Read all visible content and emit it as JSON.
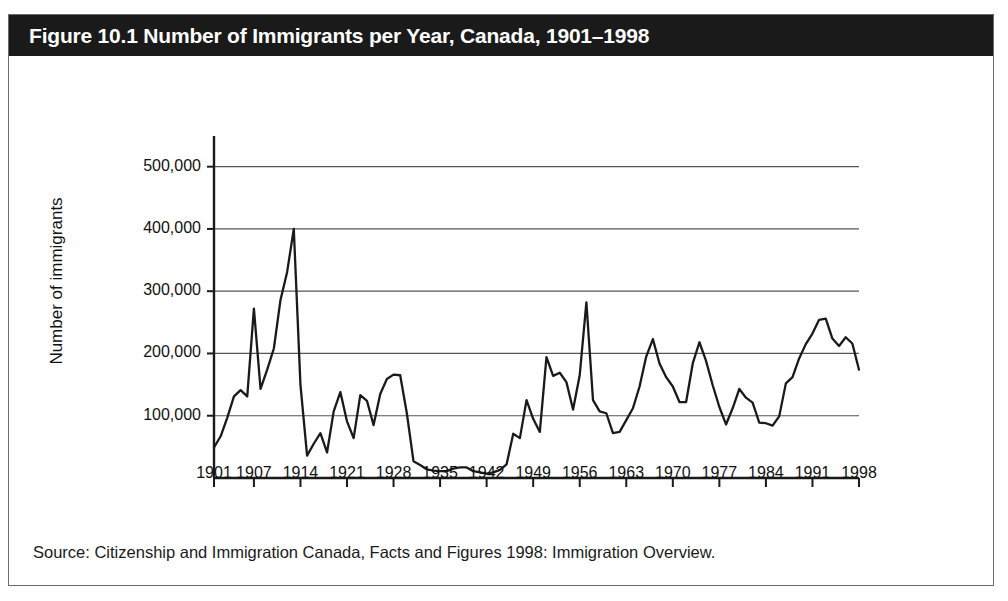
{
  "figure": {
    "title": "Figure 10.1 Number of Immigrants per Year, Canada, 1901–1998",
    "source": "Source: Citizenship and Immigration Canada, Facts and Figures 1998: Immigration Overview.",
    "title_bar_color": "#1a1a1a",
    "title_text_color": "#ffffff",
    "border_color": "#6b6b6b",
    "line_color": "#1a1a1a",
    "grid_color": "#555555"
  },
  "chart_data": {
    "type": "line",
    "title": "Figure 10.1 Number of Immigrants per Year, Canada, 1901–1998",
    "xlabel": "",
    "ylabel": "Number of immigrants",
    "xlim": [
      1901,
      1998
    ],
    "ylim": [
      0,
      530000
    ],
    "grid": true,
    "legend": "none",
    "ytick_labels": [
      "100,000",
      "200,000",
      "300,000",
      "400,000",
      "500,000"
    ],
    "ytick_values": [
      100000,
      200000,
      300000,
      400000,
      500000
    ],
    "xtick_labels": [
      "1901",
      "1907",
      "1914",
      "1921",
      "1928",
      "1935",
      "1942",
      "1949",
      "1956",
      "1963",
      "1970",
      "1977",
      "1984",
      "1991",
      "1998"
    ],
    "xtick_values": [
      1901,
      1907,
      1914,
      1921,
      1928,
      1935,
      1942,
      1949,
      1956,
      1963,
      1970,
      1977,
      1984,
      1991,
      1998
    ],
    "series": [
      {
        "name": "Number of immigrants",
        "x": [
          1901,
          1902,
          1903,
          1904,
          1905,
          1906,
          1907,
          1908,
          1909,
          1910,
          1911,
          1912,
          1913,
          1914,
          1915,
          1916,
          1917,
          1918,
          1919,
          1920,
          1921,
          1922,
          1923,
          1924,
          1925,
          1926,
          1927,
          1928,
          1929,
          1930,
          1931,
          1932,
          1933,
          1934,
          1935,
          1936,
          1937,
          1938,
          1939,
          1940,
          1941,
          1942,
          1943,
          1944,
          1945,
          1946,
          1947,
          1948,
          1949,
          1950,
          1951,
          1952,
          1953,
          1954,
          1955,
          1956,
          1957,
          1958,
          1959,
          1960,
          1961,
          1962,
          1963,
          1964,
          1965,
          1966,
          1967,
          1968,
          1969,
          1970,
          1971,
          1972,
          1973,
          1974,
          1975,
          1976,
          1977,
          1978,
          1979,
          1980,
          1981,
          1982,
          1983,
          1984,
          1985,
          1986,
          1987,
          1988,
          1989,
          1990,
          1991,
          1992,
          1993,
          1994,
          1995,
          1996,
          1997,
          1998
        ],
        "y": [
          49000,
          67000,
          97000,
          131000,
          141000,
          131000,
          272000,
          143000,
          174000,
          208000,
          286000,
          331000,
          400000,
          150000,
          36000,
          55000,
          72000,
          41000,
          107000,
          138000,
          91000,
          64000,
          133000,
          124000,
          85000,
          135000,
          159000,
          166000,
          165000,
          104000,
          27000,
          21000,
          14000,
          12000,
          11000,
          11000,
          15000,
          17000,
          17000,
          11000,
          9000,
          7000,
          9000,
          13000,
          22000,
          71000,
          64000,
          125000,
          95000,
          74000,
          194000,
          164000,
          169000,
          154000,
          110000,
          165000,
          282000,
          125000,
          107000,
          104000,
          72000,
          74000,
          93000,
          112000,
          147000,
          195000,
          223000,
          184000,
          162000,
          147000,
          122000,
          122000,
          184000,
          218000,
          188000,
          149000,
          114000,
          86000,
          112000,
          143000,
          129000,
          121000,
          89000,
          88000,
          84000,
          99000,
          152000,
          162000,
          192000,
          215000,
          232000,
          254000,
          256000,
          224000,
          212000,
          226000,
          216000,
          174000
        ]
      }
    ]
  },
  "axis": {
    "y_title": "Number of immigrants"
  }
}
